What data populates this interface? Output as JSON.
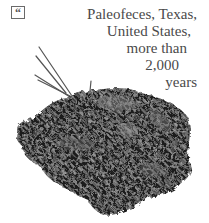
{
  "quote_icon": {
    "glyph": "“"
  },
  "caption": {
    "lines": [
      "Paleofeces, Texas,",
      "United States,",
      "more than",
      "2,000",
      "years"
    ]
  },
  "photo": {
    "subject": "paleofeces specimen"
  }
}
